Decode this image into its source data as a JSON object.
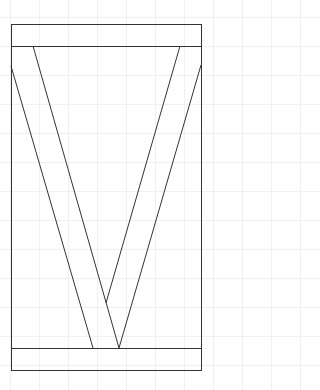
{
  "diagram": {
    "type": "structural-frame-v-brace",
    "stroke_color": "#333333",
    "background": "#ffffff",
    "grid_color": "#f0f0f0",
    "frame": {
      "x": 11,
      "y": 24,
      "width": 190,
      "height": 346
    },
    "top_rail": {
      "x": 11,
      "y": 24,
      "width": 190,
      "height": 22
    },
    "bottom_rail": {
      "x": 11,
      "y": 348,
      "width": 190,
      "height": 22
    },
    "left_brace": {
      "outer": {
        "x1": 11,
        "y1": 66,
        "x2": 93,
        "y2": 348
      },
      "inner": {
        "x1": 33,
        "y1": 46,
        "x2": 119,
        "y2": 348
      }
    },
    "right_brace": {
      "outer": {
        "x1": 201,
        "y1": 65,
        "x2": 119,
        "y2": 348
      },
      "inner": {
        "x1": 180,
        "y1": 46,
        "x2": 106,
        "y2": 303
      }
    }
  }
}
